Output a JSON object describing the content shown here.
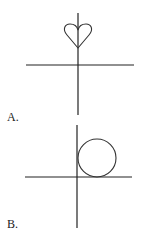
{
  "figures": [
    {
      "label": "A.",
      "shape": "heart",
      "description": "Heart shape centered on vertical axis above horizontal axis"
    },
    {
      "label": "B.",
      "shape": "circle",
      "description": "Circle in first quadrant tangent to both axes"
    }
  ],
  "colors": {
    "stroke": "#222222",
    "background": "#ffffff"
  }
}
